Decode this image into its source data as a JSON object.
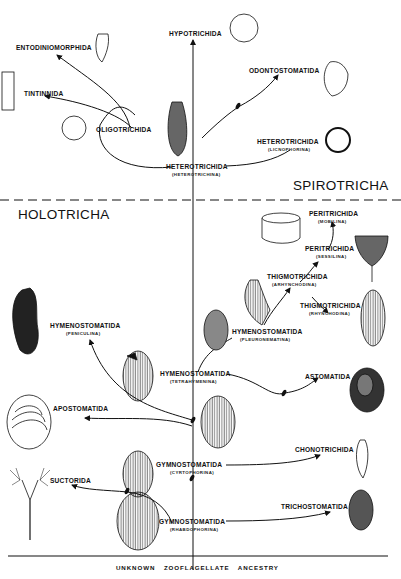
{
  "diagram": {
    "type": "phylogenetic-tree",
    "root_label": "UNKNOWN ZOOFLAGELLATE ANCESTRY",
    "groups": {
      "upper": "SPIROTRICHA",
      "lower": "HOLOTRICHA"
    },
    "nodes": [
      {
        "id": "entodiniomorphida",
        "name": "ENTODINIOMORPHIDA",
        "sub": ""
      },
      {
        "id": "hypotrichida",
        "name": "HYPOTRICHIDA",
        "sub": ""
      },
      {
        "id": "tintinnida",
        "name": "TINTINNIDA",
        "sub": ""
      },
      {
        "id": "odontostomatida",
        "name": "ODONTOSTOMATIDA",
        "sub": ""
      },
      {
        "id": "oligotrichida",
        "name": "OLIGOTRICHIDA",
        "sub": ""
      },
      {
        "id": "heterotrichida-licnophorina",
        "name": "HETEROTRICHIDA",
        "sub": "(LICNOPHORINA)"
      },
      {
        "id": "heterotrichida-heterotrichina",
        "name": "HETEROTRICHIDA",
        "sub": "(HETEROTRICHINA)"
      },
      {
        "id": "peritrichida-mobilina",
        "name": "PERITRICHIDA",
        "sub": "(MOBILINA)"
      },
      {
        "id": "peritrichida-sessilina",
        "name": "PERITRICHIDA",
        "sub": "(SESSILINA)"
      },
      {
        "id": "thigmotrichida-arhynchodina",
        "name": "THIGMOTRICHIDA",
        "sub": "(ARHYNCHODINA)"
      },
      {
        "id": "thigmotrichida-rhynchodina",
        "name": "THIGMOTRICHIDA",
        "sub": "(RHYNCHODINA)"
      },
      {
        "id": "hymenostomatida-peniculina",
        "name": "HYMENOSTOMATIDA",
        "sub": "(PENICULINA)"
      },
      {
        "id": "hymenostomatida-pleuronematina",
        "name": "HYMENOSTOMATIDA",
        "sub": "(PLEURONEMATINA)"
      },
      {
        "id": "hymenostomatida-tetrahymenina",
        "name": "HYMENOSTOMATIDA",
        "sub": "(TETRAHYMENINA)"
      },
      {
        "id": "astomatida",
        "name": "ASTOMATIDA",
        "sub": ""
      },
      {
        "id": "apostomatida",
        "name": "APOSTOMATIDA",
        "sub": ""
      },
      {
        "id": "chonotrichida",
        "name": "CHONOTRICHIDA",
        "sub": ""
      },
      {
        "id": "gymnostomatida-cyrtophorina",
        "name": "GYMNOSTOMATIDA",
        "sub": "(CYRTOPHORINA)"
      },
      {
        "id": "suctorida",
        "name": "SUCTORIDA",
        "sub": ""
      },
      {
        "id": "trichostomatida",
        "name": "TRICHOSTOMATIDA",
        "sub": ""
      },
      {
        "id": "gymnostomatida-rhabdophorina",
        "name": "GYMNOSTOMATIDA",
        "sub": "(RHABDOPHORINA)"
      }
    ],
    "colors": {
      "ink": "#111111",
      "background": "#ffffff",
      "shade": "#555555"
    }
  }
}
